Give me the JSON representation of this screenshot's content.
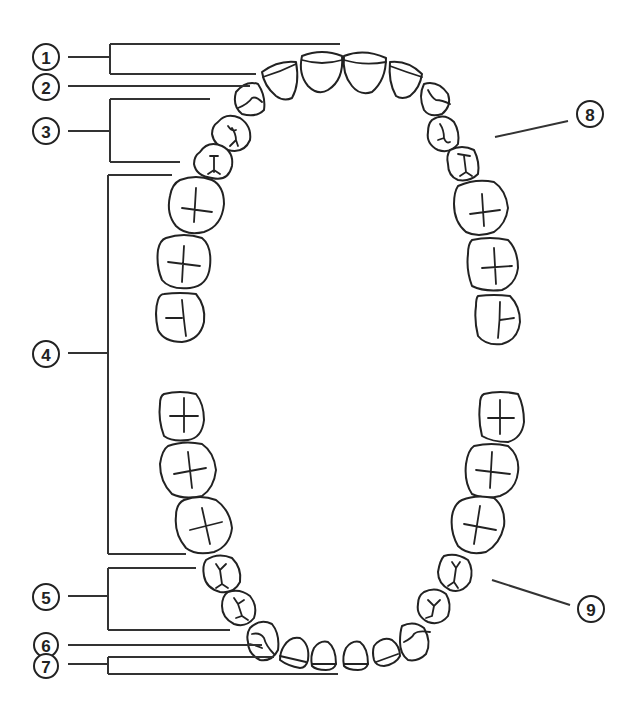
{
  "diagram": {
    "colors": {
      "stroke": "#222222",
      "background": "#ffffff"
    },
    "callouts": [
      {
        "id": 1,
        "label": "1",
        "target": "upper-central-and-lateral-incisors"
      },
      {
        "id": 2,
        "label": "2",
        "target": "upper-canine"
      },
      {
        "id": 3,
        "label": "3",
        "target": "upper-premolars"
      },
      {
        "id": 4,
        "label": "4",
        "target": "molars-upper-and-lower"
      },
      {
        "id": 5,
        "label": "5",
        "target": "lower-premolars"
      },
      {
        "id": 6,
        "label": "6",
        "target": "lower-canine"
      },
      {
        "id": 7,
        "label": "7",
        "target": "lower-incisors"
      },
      {
        "id": 8,
        "label": "8",
        "target": "upper-arch"
      },
      {
        "id": 9,
        "label": "9",
        "target": "lower-arch"
      }
    ],
    "upper_arch": {
      "teeth_count": 16,
      "groups": [
        "molars",
        "premolars",
        "canine",
        "incisors",
        "canine",
        "premolars",
        "molars"
      ]
    },
    "lower_arch": {
      "teeth_count": 16,
      "groups": [
        "molars",
        "premolars",
        "canine",
        "incisors",
        "canine",
        "premolars",
        "molars"
      ]
    }
  }
}
